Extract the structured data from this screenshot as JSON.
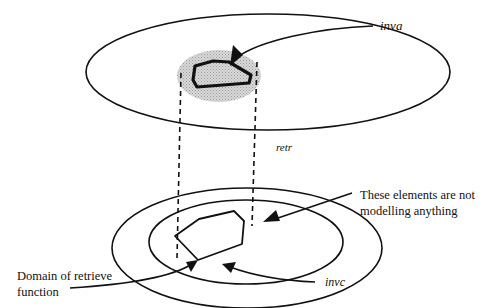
{
  "diagram": {
    "labels": {
      "inva": "inva",
      "retr": "retr",
      "invc": "invc",
      "not_modelling_line1": "These elements are not",
      "not_modelling_line2": "modelling anything",
      "domain_line1": "Domain of retrieve",
      "domain_line2": "function"
    },
    "colors": {
      "stroke": "#111111",
      "shade": "#c8c8c8",
      "background": "#ffffff"
    }
  }
}
